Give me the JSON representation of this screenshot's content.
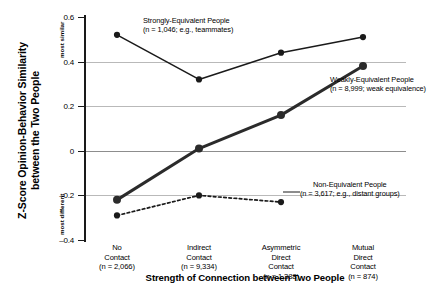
{
  "chart_data": {
    "type": "line",
    "title": "",
    "xlabel": "Strength of Connection between Two People",
    "ylabel_line1": "Z-Score Opinion-Behavior Similarity",
    "ylabel_line2": "between the Two People",
    "y_high_label": "most similar",
    "y_low_label": "most different",
    "ylim": [
      -0.4,
      0.6
    ],
    "yticks": [
      "0.6",
      "0.4",
      "0.2",
      "0",
      "–0.2",
      "–0.4"
    ],
    "ytick_values": [
      0.6,
      0.4,
      0.2,
      0,
      -0.2,
      -0.4
    ],
    "grid": true,
    "gridlines_at": [
      0.4,
      0.2,
      0,
      -0.2
    ],
    "legend_position": "inline-annotations",
    "categories": [
      {
        "line1": "No",
        "line2": "Contact",
        "line3": "",
        "n": "(n = 2,066)"
      },
      {
        "line1": "Indirect",
        "line2": "Contact",
        "line3": "",
        "n": "(n = 9,334)"
      },
      {
        "line1": "Asymmetric",
        "line2": "Direct",
        "line3": "Contact",
        "n": "(n = 1,388)"
      },
      {
        "line1": "Mutual",
        "line2": "Direct",
        "line3": "Contact",
        "n": "(n = 874)"
      }
    ],
    "series": [
      {
        "name": "Strongly-Equivalent People",
        "annotation_line1": "Strongly-Equivalent People",
        "annotation_line2": "(n = 1,046; e.g., teammates)",
        "style": "solid-thin",
        "color": "#1a1a1a",
        "values": [
          0.52,
          0.32,
          0.44,
          0.51
        ]
      },
      {
        "name": "Weakly-Equivalent People",
        "annotation_line1": "Weakly-Equivalent People",
        "annotation_line2": "(n = 8,999; weak equivalence)",
        "style": "solid-thick",
        "color": "#2b2b2b",
        "values": [
          -0.22,
          0.01,
          0.16,
          0.38
        ]
      },
      {
        "name": "Non-Equivalent People",
        "annotation_line1": "Non-Equivalent People",
        "annotation_line2": "(n = 3,617; e.g., distant groups)",
        "style": "dotted",
        "color": "#1a1a1a",
        "values": [
          -0.29,
          -0.2,
          -0.23,
          null
        ]
      }
    ]
  }
}
